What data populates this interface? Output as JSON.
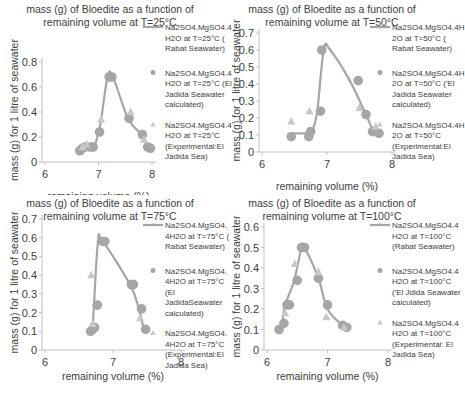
{
  "chart_data": [
    {
      "type": "line",
      "title": "mass (g) of Bloedite  as a function of remaining volume at T=25°C",
      "title_lines": [
        "mass (g) of Bloedite  as a function of",
        "remaining volume at T=25°C"
      ],
      "xlabel": "remaining volume (%)",
      "ylabel": "mass (g) for 1 litre of seawater",
      "xlim": [
        6,
        8
      ],
      "ylim": [
        0,
        0.8
      ],
      "xticks": [
        6,
        7,
        8
      ],
      "yticks": [
        0,
        0.2,
        0.4,
        0.6,
        0.8
      ],
      "ytick_labels": [
        "0",
        "0.2",
        "0.4",
        "0.6",
        "0.8"
      ],
      "grid": false,
      "legend_position": "right",
      "series": [
        {
          "name": "Na2SO4.MgSO4.4H2O at T=25°C ( Rabat Seawater)",
          "legend_lines": [
            "Na2SO4.MgSO4.4",
            "H2O at T=25°C (",
            "Rabat Seawater)"
          ],
          "marker": "line",
          "x": [
            6.65,
            6.72,
            6.8,
            6.92,
            7.0,
            7.05,
            7.17,
            7.27,
            7.55,
            7.8,
            7.92,
            7.98
          ],
          "y": [
            0.1,
            0.12,
            0.13,
            0.13,
            0.24,
            0.34,
            0.68,
            0.68,
            0.35,
            0.22,
            0.13,
            0.11
          ]
        },
        {
          "name": "Na2SO4.MgSO4.4H2O at T=25°C (El Jadida Seawater calculated)",
          "legend_lines": [
            "Na2SO4.MgSO4.4",
            "H2O at T=25°C (El",
            "Jadida Seawater",
            "calculated)"
          ],
          "marker": "circle",
          "x": [
            6.65,
            6.7,
            6.75,
            6.85,
            6.9,
            7.02,
            7.2,
            7.25,
            7.57,
            7.82,
            7.92,
            7.97
          ],
          "y": [
            0.09,
            0.11,
            0.12,
            0.12,
            0.12,
            0.24,
            0.68,
            0.68,
            0.35,
            0.22,
            0.12,
            0.11
          ]
        },
        {
          "name": "Na2SO4.MgSO4.4H2O at T=25°C (Experimental:El Jadida Sea)",
          "legend_lines": [
            "Na2SO4.MgSO4.4",
            "H2O at T=25°C",
            "(Experimental:El",
            "Jadida Sea)"
          ],
          "marker": "triangle",
          "x": [
            6.7,
            6.78,
            7.05,
            7.6,
            7.85
          ],
          "y": [
            0.12,
            0.14,
            0.34,
            0.4,
            0.18
          ]
        }
      ]
    },
    {
      "type": "line",
      "title": "mass (g) of Bloedite  as a function of remaining volume at T=50°C",
      "title_lines": [
        "mass (g) of Bloedite  as a function of",
        "remaining volume at T=50°C"
      ],
      "xlabel": "remaining volume (%)",
      "ylabel": "mass (g) for 1 litre of seawater",
      "xlim": [
        6,
        8
      ],
      "ylim": [
        0,
        0.7
      ],
      "xticks": [
        6,
        7,
        8
      ],
      "yticks": [
        0,
        0.1,
        0.2,
        0.3,
        0.4,
        0.5,
        0.6,
        0.7
      ],
      "ytick_labels": [
        "0",
        "0.1",
        "0.2",
        "0.3",
        "0.4",
        "0.5",
        "0.6",
        "0.7"
      ],
      "grid": false,
      "legend_position": "right",
      "series": [
        {
          "name": "Na2SO4.MgSO4.4H2O at T=50°C ( Rabat Seawater)",
          "legend_lines": [
            "Na2SO4.MgSO4.4H",
            "2O at T=50°C (",
            "Rabat Seawater)"
          ],
          "marker": "line",
          "x": [
            6.47,
            6.72,
            6.77,
            6.85,
            6.95,
            7.05,
            7.35,
            7.6,
            7.72,
            7.8
          ],
          "y": [
            0.11,
            0.11,
            0.12,
            0.24,
            0.6,
            0.6,
            0.42,
            0.22,
            0.12,
            0.11
          ]
        },
        {
          "name": "Na2SO4.MgSO4.4H2O at T=50°C ('El Jadida Seawater calculated)",
          "legend_lines": [
            "Na2SO4.MgSO4.4H",
            "2O at T=50°C ('El",
            "Jadida Seawater",
            "calculated)"
          ],
          "marker": "circle",
          "x": [
            6.45,
            6.72,
            6.75,
            6.9,
            6.92,
            7.48,
            7.6,
            7.7,
            7.8
          ],
          "y": [
            0.09,
            0.09,
            0.12,
            0.24,
            0.6,
            0.42,
            0.22,
            0.12,
            0.11
          ]
        },
        {
          "name": "Na2SO4.MgSO4.4H2O at T=50°C (Experimental:El Jadida Sea)",
          "legend_lines": [
            "Na2SO4.MgSO4.4H",
            "2O at T=50°C",
            "(Experimental:El",
            "Jadida Sea)"
          ],
          "marker": "triangle",
          "x": [
            6.45,
            6.73,
            7.5,
            7.75
          ],
          "y": [
            0.18,
            0.24,
            0.26,
            0.15
          ]
        }
      ]
    },
    {
      "type": "line",
      "title": "mass (g) of Bloedite  as a function of remaining volume at T=75°C",
      "title_lines": [
        "mass (g) of Bloedite  as a function of",
        "remaining volume at T=75°C"
      ],
      "xlabel": "remaining volume (%)",
      "ylabel": "mass (g) for 1 litre of seawater",
      "xlim": [
        6,
        8
      ],
      "ylim": [
        0,
        0.7
      ],
      "xticks": [
        6,
        7,
        8
      ],
      "yticks": [
        0,
        0.1,
        0.2,
        0.3,
        0.4,
        0.5,
        0.6,
        0.7
      ],
      "ytick_labels": [
        "0",
        "0.1",
        "0.2",
        "0.3",
        "0.4",
        "0.5",
        "0.6",
        "0.7"
      ],
      "grid": false,
      "legend_position": "right",
      "series": [
        {
          "name": "Na2SO4.MgSO4.4H2O at T=75°C ( Rabat Seawater)",
          "legend_lines": [
            "Na2SO4.MgSO4.",
            "4H2O at T=75°C (",
            "Rabat Seawater)"
          ],
          "marker": "line",
          "x": [
            6.68,
            6.7,
            6.72,
            6.78,
            6.85,
            7.25,
            7.38,
            7.45
          ],
          "y": [
            0.1,
            0.12,
            0.24,
            0.58,
            0.58,
            0.35,
            0.22,
            0.11
          ]
        },
        {
          "name": "Na2SO4.MgSO4.4H2O at T=75°C (El JadidaSeawater calculated)",
          "legend_lines": [
            "Na2SO4.MgSO4.",
            "4H2O at T=75°C",
            "(El",
            "JadidaSeawater",
            "calculated)"
          ],
          "marker": "circle",
          "x": [
            6.67,
            6.7,
            6.73,
            6.77,
            6.85,
            6.88,
            7.27,
            7.3,
            7.42,
            7.48
          ],
          "y": [
            0.1,
            0.11,
            0.12,
            0.24,
            0.58,
            0.58,
            0.35,
            0.35,
            0.22,
            0.11
          ]
        },
        {
          "name": "Na2SO4.MgSO4.4H2O at T=75°C (Experimental:El Jadida Sea)",
          "legend_lines": [
            "Na2SO4.MgSO4.",
            "4H2O at T=75°C",
            "(Experimental:El",
            "Jadida Sea)"
          ],
          "marker": "triangle",
          "x": [
            6.68,
            6.7,
            7.4
          ],
          "y": [
            0.4,
            0.14,
            0.17
          ]
        }
      ]
    },
    {
      "type": "line",
      "title": "mass (g) of Bloedite  as a function of remaining volume at T=100°C",
      "title_lines": [
        "mass (g) of Bloedite  as a function of",
        "remaining volume at T=100°C"
      ],
      "xlabel": "remaining volume (%)",
      "ylabel": "mass (g) for 1 litre of seawater",
      "xlim": [
        6,
        8
      ],
      "ylim": [
        0,
        0.6
      ],
      "xticks": [
        6,
        7,
        8
      ],
      "yticks": [
        0,
        0.1,
        0.2,
        0.3,
        0.4,
        0.5,
        0.6
      ],
      "ytick_labels": [
        "0",
        "0.1",
        "0.2",
        "0.3",
        "0.4",
        "0.5",
        "0.6"
      ],
      "grid": false,
      "legend_position": "right",
      "series": [
        {
          "name": "Na2SO4.MgSO4.4H2O at T=100°C (Rabat Seawater)",
          "legend_lines": [
            "Na2SO4.MgSO4.4",
            "H2O at T=100°C",
            "(Rabat Seawater)"
          ],
          "marker": "line",
          "x": [
            6.2,
            6.25,
            6.3,
            6.45,
            6.57,
            6.62,
            6.85,
            7.0,
            7.25,
            7.3
          ],
          "y": [
            0.1,
            0.13,
            0.22,
            0.34,
            0.5,
            0.5,
            0.35,
            0.2,
            0.12,
            0.11
          ]
        },
        {
          "name": "Na2SO4.MgSO4.4H2O at T=100°C ('El Jdida Seawater calculated)",
          "legend_lines": [
            "Na2SO4.MgSO4.4",
            "H2O at T=100°C",
            "('El Jdida Seawater",
            "calculated)"
          ],
          "marker": "circle",
          "x": [
            6.2,
            6.28,
            6.33,
            6.37,
            6.5,
            6.57,
            6.62,
            6.85,
            7.0,
            7.25,
            7.32
          ],
          "y": [
            0.1,
            0.13,
            0.22,
            0.22,
            0.34,
            0.5,
            0.5,
            0.35,
            0.22,
            0.12,
            0.11
          ]
        },
        {
          "name": "Na2SO4.MgSO4.4H2O at T=100°C (Experimental: El Jadida Sea)",
          "legend_lines": [
            "Na2SO4.MgSO4.4",
            "H2O at T=100°C",
            "(Experimental: El",
            "Jadida Sea)"
          ],
          "marker": "triangle",
          "x": [
            6.3,
            6.46,
            6.85,
            6.98,
            7.27
          ],
          "y": [
            0.18,
            0.42,
            0.38,
            0.16,
            0.11
          ]
        }
      ]
    }
  ],
  "layout": {
    "colors": {
      "line": "#a6a6a6",
      "circle": "#a6a6a6",
      "triangle": "#c8c8c8",
      "axis": "#bfbfbf",
      "text": "#404040"
    },
    "panels": [
      {
        "left": 0,
        "top": 0,
        "width": 232,
        "height": 195,
        "plot": {
          "x0": 45,
          "x1": 152,
          "y0": 162,
          "y1": 62,
          "axis_x": 42
        },
        "legend": {
          "x": 165,
          "y": 28
        }
      },
      {
        "left": 232,
        "top": 0,
        "width": 233,
        "height": 195,
        "plot": {
          "x0": 30,
          "x1": 160,
          "y0": 152,
          "y1": 33,
          "axis_x": 27
        },
        "legend": {
          "x": 160,
          "y": 28
        }
      },
      {
        "left": 0,
        "top": 195,
        "width": 232,
        "height": 200,
        "plot": {
          "x0": 45,
          "x1": 181,
          "y0": 155,
          "y1": 24,
          "axis_x": 42
        },
        "legend": {
          "x": 165,
          "y": 28
        }
      },
      {
        "left": 232,
        "top": 195,
        "width": 233,
        "height": 200,
        "plot": {
          "x0": 35,
          "x1": 156,
          "y0": 155,
          "y1": 32,
          "axis_x": 32
        },
        "legend": {
          "x": 160,
          "y": 28
        }
      }
    ]
  }
}
